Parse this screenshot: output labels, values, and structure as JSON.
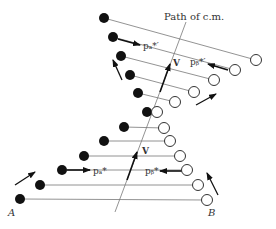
{
  "title_label": "Path of c.m.",
  "labels": {
    "v_upper": "V",
    "v_lower": "V",
    "pa_prime": "pₐ*′",
    "pb_prime": "pᵦ*′",
    "pa": "pₐ*",
    "pb": "pᵦ*",
    "point_a": "A",
    "point_b": "B"
  },
  "colors": {
    "ink": "#111111",
    "thin_line": "#777777",
    "background": "#ffffff"
  },
  "particles": {
    "a_filled": [
      [
        20,
        199
      ],
      [
        40,
        185
      ],
      [
        62,
        170
      ],
      [
        84,
        156
      ],
      [
        104,
        141
      ],
      [
        124,
        127
      ],
      [
        147,
        112
      ],
      [
        138,
        93
      ],
      [
        130,
        75
      ],
      [
        121,
        56
      ],
      [
        113,
        37
      ],
      [
        104,
        18
      ]
    ],
    "b_open": [
      [
        207,
        200
      ],
      [
        198,
        185
      ],
      [
        187,
        170
      ],
      [
        180,
        156
      ],
      [
        170,
        141
      ],
      [
        164,
        128
      ],
      [
        157,
        112
      ],
      [
        175,
        102
      ],
      [
        194,
        92
      ],
      [
        214,
        80
      ],
      [
        235,
        70
      ],
      [
        256,
        60
      ]
    ]
  }
}
